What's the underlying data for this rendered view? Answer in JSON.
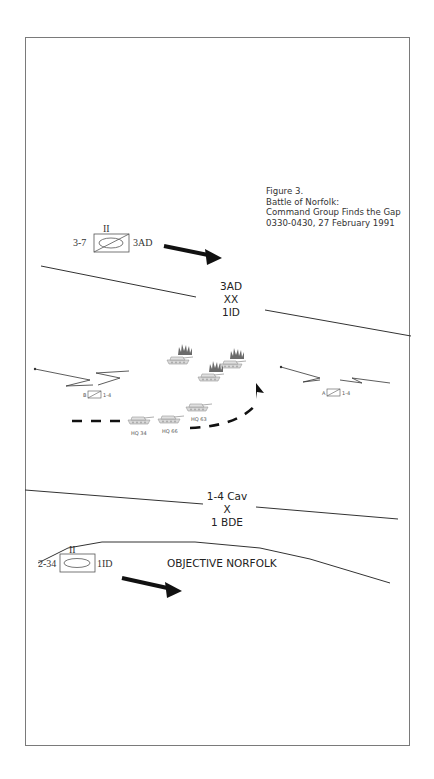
{
  "figure": {
    "caption": [
      "Figure 3.",
      "Battle of Norfolk:",
      "Command Group Finds the Gap",
      "0330-0430, 27 February 1991"
    ]
  },
  "boundaries": {
    "upper": {
      "top": "3AD",
      "symbol": "XX",
      "bottom": "1ID"
    },
    "lower": {
      "top": "1-4 Cav",
      "symbol": "X",
      "bottom": "1 BDE"
    }
  },
  "units": {
    "north": {
      "designation": "3-7",
      "echelon": "II",
      "parent": "3AD",
      "type": "armored-cavalry"
    },
    "south": {
      "designation": "2-34",
      "echelon": "II",
      "parent": "1ID",
      "type": "armor"
    },
    "left_screen": {
      "left_label": "B",
      "right_label": "1-4"
    },
    "right_screen": {
      "left_label": "A",
      "right_label": "1-4"
    }
  },
  "vehicles": {
    "friendly": [
      {
        "label": "HQ 34"
      },
      {
        "label": "HQ 66"
      },
      {
        "label": "HQ 63"
      }
    ],
    "destroyed_enemy_count": 3
  },
  "objective": {
    "label": "OBJECTIVE NORFOLK"
  },
  "colors": {
    "line": "#333333",
    "frame": "#7a7a7a",
    "arrow": "#111111",
    "vehicle": "#c8c8c8",
    "fire": "#555555"
  }
}
